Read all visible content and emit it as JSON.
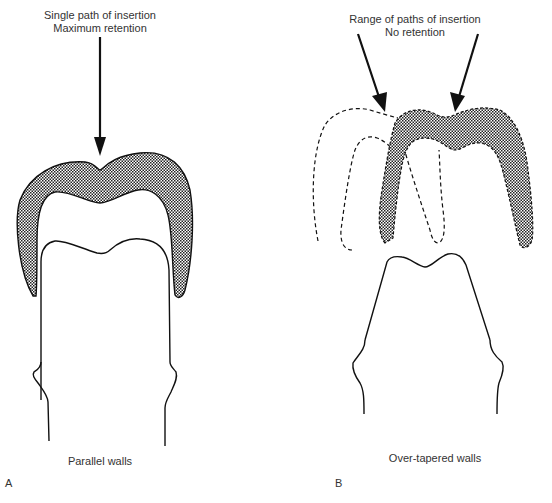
{
  "figure": {
    "panel_a": {
      "letter": "A",
      "annotation_line1": "Single path of insertion",
      "annotation_line2": "Maximum retention",
      "caption": "Parallel walls"
    },
    "panel_b": {
      "letter": "B",
      "annotation_line1": "Range of paths of insertion",
      "annotation_line2": "No retention",
      "caption": "Over-tapered walls"
    },
    "colors": {
      "line": "#111111",
      "hatch_dark": "#222222",
      "background": "#ffffff"
    }
  }
}
